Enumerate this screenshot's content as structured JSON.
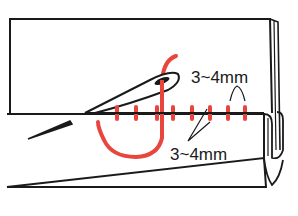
{
  "diagram": {
    "colors": {
      "outline": "#1a1a1a",
      "thread": "#e8463c",
      "background": "#ffffff"
    },
    "labels": {
      "top_spacing": "3~4mm",
      "bottom_spacing": "3~4mm"
    },
    "stitch_x_positions": [
      117,
      136,
      157,
      173,
      192,
      210,
      228,
      245
    ],
    "fold_line_y": 113
  }
}
